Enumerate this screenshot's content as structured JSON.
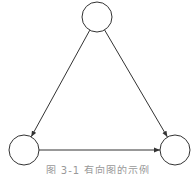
{
  "diagram": {
    "type": "directed-graph",
    "stroke_color": "#333333",
    "fill_color": "#ffffff",
    "nodes": [
      {
        "id": "top",
        "cx": 97,
        "cy": 17,
        "r": 15
      },
      {
        "id": "bottom-left",
        "cx": 24,
        "cy": 150,
        "r": 15
      },
      {
        "id": "bottom-right",
        "cx": 175,
        "cy": 150,
        "r": 15
      }
    ],
    "edges": [
      {
        "from": "top",
        "to": "bottom-left"
      },
      {
        "from": "top",
        "to": "bottom-right"
      },
      {
        "from": "bottom-left",
        "to": "bottom-right"
      }
    ]
  },
  "caption": "图 3-1 有向图的示例"
}
